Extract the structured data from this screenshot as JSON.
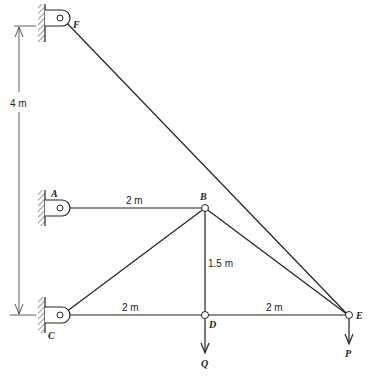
{
  "diagram": {
    "type": "truss",
    "nodes": {
      "F": {
        "label": "F",
        "support": "pin-wall"
      },
      "A": {
        "label": "A",
        "support": "pin-wall"
      },
      "C": {
        "label": "C",
        "support": "pin-wall"
      },
      "B": {
        "label": "B"
      },
      "D": {
        "label": "D"
      },
      "E": {
        "label": "E"
      }
    },
    "members": [
      [
        "A",
        "B"
      ],
      [
        "C",
        "B"
      ],
      [
        "C",
        "D"
      ],
      [
        "B",
        "D"
      ],
      [
        "D",
        "E"
      ],
      [
        "B",
        "E"
      ],
      [
        "F",
        "E"
      ]
    ],
    "dimensions": {
      "AB": "2 m",
      "CD": "2 m",
      "DE": "2 m",
      "BD": "1.5 m",
      "CF": "4 m"
    },
    "loads": {
      "Q": {
        "label": "Q",
        "at": "D",
        "direction": "down"
      },
      "P": {
        "label": "P",
        "at": "E",
        "direction": "down"
      }
    }
  }
}
